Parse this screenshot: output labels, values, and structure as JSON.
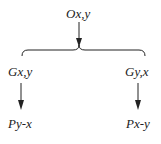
{
  "diagram": {
    "top_node": {
      "label": "Ox,y"
    },
    "left_middle": {
      "label": "Gx,y"
    },
    "right_middle": {
      "label": "Gy,x"
    },
    "left_bottom": {
      "label": "Py-x"
    },
    "right_bottom": {
      "label": "Px-y"
    },
    "line_color": "#222222"
  }
}
